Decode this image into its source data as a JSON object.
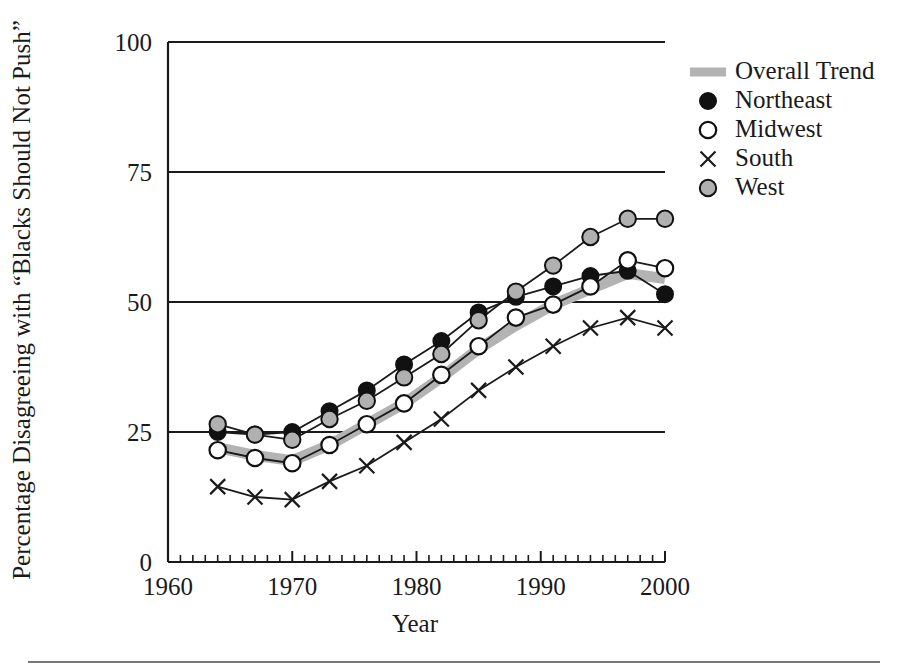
{
  "chart_data": {
    "type": "line",
    "title": "",
    "xlabel": "Year",
    "ylabel": "Percentage Disagreeing with “Blacks Should Not Push”",
    "xlim": [
      1960,
      2000
    ],
    "ylim": [
      0,
      100
    ],
    "xticks": [
      1960,
      1970,
      1980,
      1990,
      2000
    ],
    "xtick_labels": [
      "1960",
      "1970",
      "1980",
      "1990",
      "2000"
    ],
    "yticks": [
      0,
      25,
      50,
      75,
      100
    ],
    "ytick_labels": [
      "0",
      "25",
      "50",
      "75",
      "100"
    ],
    "x_minor_tick_interval": 1,
    "grid": "horizontal gridlines at 25, 50, 75, 100",
    "legend_position": "right",
    "x": [
      1964,
      1967,
      1970,
      1973,
      1976,
      1979,
      1982,
      1985,
      1988,
      1991,
      1994,
      1997,
      2000
    ],
    "series": [
      {
        "name": "Overall Trend",
        "marker": "thick-gray-line",
        "color": "#b3b3b3",
        "values": [
          22.0,
          20.5,
          19.5,
          22.5,
          26.5,
          30.5,
          35.5,
          41.0,
          45.5,
          49.5,
          52.5,
          55.5,
          54.5
        ]
      },
      {
        "name": "Northeast",
        "marker": "filled-circle",
        "color": "#111111",
        "values": [
          25.0,
          24.5,
          25.0,
          29.0,
          33.0,
          38.0,
          42.5,
          48.0,
          51.0,
          53.0,
          55.0,
          56.0,
          51.5
        ]
      },
      {
        "name": "Midwest",
        "marker": "open-circle",
        "color": "#ffffff",
        "values": [
          21.5,
          20.0,
          19.0,
          22.5,
          26.5,
          30.5,
          36.0,
          41.5,
          47.0,
          49.5,
          53.0,
          58.0,
          56.5
        ]
      },
      {
        "name": "South",
        "marker": "x",
        "color": "#1a1a1a",
        "values": [
          14.5,
          12.5,
          12.0,
          15.5,
          18.5,
          23.0,
          27.5,
          33.0,
          37.5,
          41.5,
          45.0,
          47.0,
          45.0
        ]
      },
      {
        "name": "West",
        "marker": "gray-circle",
        "color": "#b0b0b0",
        "values": [
          26.5,
          24.5,
          23.5,
          27.5,
          31.0,
          35.5,
          40.0,
          46.5,
          52.0,
          57.0,
          62.5,
          66.0,
          66.0
        ]
      }
    ]
  },
  "legend": {
    "entries": [
      {
        "label": "Overall Trend",
        "marker": "thick-gray-line"
      },
      {
        "label": "Northeast",
        "marker": "filled-circle"
      },
      {
        "label": "Midwest",
        "marker": "open-circle"
      },
      {
        "label": "South",
        "marker": "x"
      },
      {
        "label": "West",
        "marker": "gray-circle"
      }
    ]
  }
}
